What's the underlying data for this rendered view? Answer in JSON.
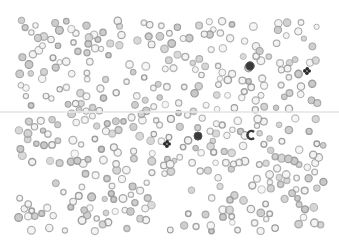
{
  "image": {
    "description": "Grayscale light-microscope blood smear showing many red blood cells (ring-shaped) scattered on a white field, with a few darkly stained white blood cells / platelet clumps and a faint horizontal streak across the middle.",
    "colors": {
      "background": "#ffffff",
      "rbc_ring": "#9a9a9a",
      "rbc_fill": "#c8c8c8",
      "dark_cell": "#2a2a2a",
      "streak": "#e6e6e6"
    },
    "features": [
      {
        "name": "red-blood-cells",
        "count_estimate": 400
      },
      {
        "name": "dark-stained-cell",
        "count": 5
      },
      {
        "name": "horizontal-streak",
        "count": 1
      }
    ]
  }
}
